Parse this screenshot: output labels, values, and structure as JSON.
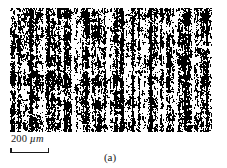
{
  "figure": {
    "panel_caption": "(a)",
    "background_color": "#ffffff",
    "ink_color": "#1a1a1a"
  },
  "micrograph": {
    "alt_name": "binary-threshold-micrograph",
    "description": "High-contrast black and white thresholded micrograph showing vertically striated microstructure",
    "foreground_color": "#000000",
    "background_color": "#ffffff",
    "left": 10,
    "top": 8,
    "width": 202,
    "height": 124
  },
  "scalebar": {
    "value": "200",
    "unit": "µm",
    "label": "200 µm",
    "bar_length_px": 39,
    "color": "#1a1a1a"
  }
}
